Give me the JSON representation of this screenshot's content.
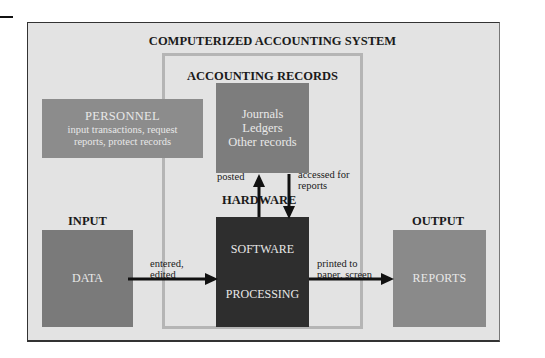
{
  "diagram": {
    "title": "COMPUTERIZED ACCOUNTING SYSTEM",
    "records_section": {
      "title": "ACCOUNTING RECORDS",
      "box_lines": [
        "Journals",
        "Ledgers",
        "Other records"
      ]
    },
    "personnel": {
      "heading": "PERSONNEL",
      "description_lines": [
        "input transactions, request",
        "reports, protect records"
      ]
    },
    "hardware_label": "HARDWARE",
    "software": {
      "top": "SOFTWARE",
      "bottom": "PROCESSING"
    },
    "input": {
      "section": "INPUT",
      "box": "DATA"
    },
    "output": {
      "section": "OUTPUT",
      "box": "REPORTS"
    },
    "arrows": {
      "posted": "posted",
      "accessed_lines": [
        "accessed for",
        "reports"
      ],
      "entered_lines": [
        "entered,",
        "edited"
      ],
      "printed_lines": [
        "printed to",
        "paper, screen"
      ]
    },
    "colors": {
      "background": "#e3e3e3",
      "personnel": "#8c8c8c",
      "records": "#7d7d7d",
      "software": "#2e2e2e",
      "data": "#7a7a7a",
      "reports": "#8a8a8a"
    }
  }
}
